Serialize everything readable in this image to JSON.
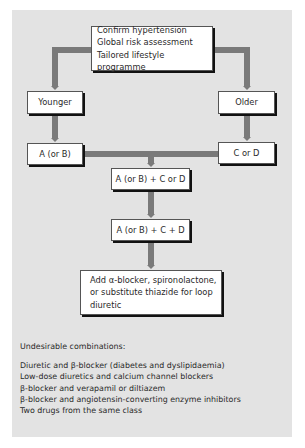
{
  "diagram": {
    "top_box": {
      "lines": [
        "Confirm hypertension",
        "Global risk assessment",
        "Tailored lifestyle programme"
      ]
    },
    "left_branch": {
      "label": "Younger",
      "step1": "A (or B)"
    },
    "right_branch": {
      "label": "Older",
      "step1": "C or D"
    },
    "step2": "A (or B) + C or D",
    "step3": "A (or B) + C + D",
    "step4": {
      "lines": [
        "Add α-blocker, spironolactone,",
        "or substitute thiazide for loop",
        "diuretic"
      ]
    },
    "colors": {
      "panel": "#e3e3e3",
      "connector": "#7a7a7a",
      "box": "#ffffff",
      "shadow": "#111111"
    }
  },
  "undesirable": {
    "title": "Undesirable combinations:",
    "items": [
      "Diuretic and β-blocker (diabetes and dyslipidaemia)",
      "Low-dose diuretics and calcium channel blockers",
      "β-blocker and verapamil or diltiazem",
      "β-blocker and angiotensin-converting enzyme inhibitors",
      "Two drugs from the same class"
    ]
  }
}
